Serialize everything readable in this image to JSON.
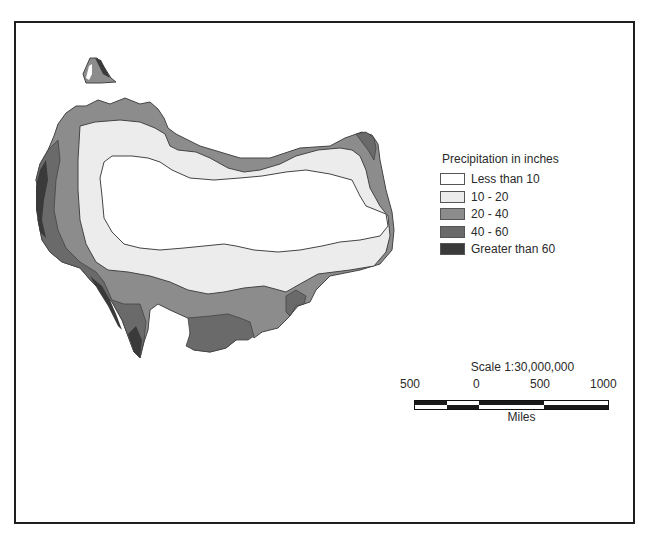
{
  "map": {
    "type": "choropleth",
    "subject": "Precipitation"
  },
  "legend": {
    "title": "Precipitation in inches",
    "items": [
      {
        "label": "Less than 10",
        "color": "#ffffff"
      },
      {
        "label": "10 - 20",
        "color": "#ececec"
      },
      {
        "label": "20 - 40",
        "color": "#8c8c8c"
      },
      {
        "label": "40 - 60",
        "color": "#6a6a6a"
      },
      {
        "label": "Greater than 60",
        "color": "#3a3a3a"
      }
    ]
  },
  "scale": {
    "title": "Scale 1:30,000,000",
    "ticks": [
      "500",
      "0",
      "500",
      "1000"
    ],
    "units": "Miles"
  }
}
